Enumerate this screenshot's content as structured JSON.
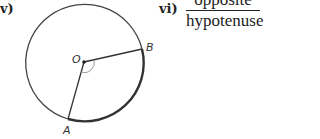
{
  "questions": {
    "v": {
      "label": "v)"
    },
    "vi": {
      "label": "vi)",
      "numerator": "opposite",
      "denominator": "hypotenuse"
    }
  },
  "diagram": {
    "center_label": "O",
    "point_a_label": "A",
    "point_b_label": "B",
    "stroke_color": "#333333",
    "angle_arc_color": "#999999"
  }
}
